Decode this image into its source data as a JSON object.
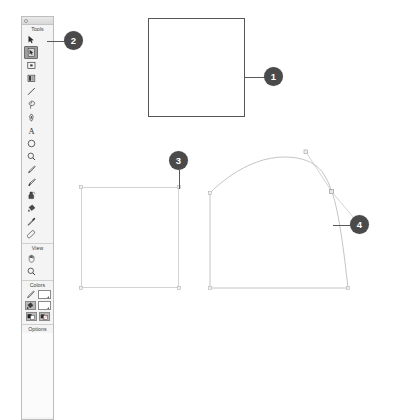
{
  "palette": {
    "title_icon": "window-dot",
    "sections": [
      {
        "id": "tools",
        "label": "Tools",
        "rows": [
          [
            {
              "name": "selection-arrow-tool",
              "icon": "arrow-pointer"
            },
            {
              "name": "subselection-tool",
              "icon": "hollow-arrow-page",
              "selected": true
            }
          ],
          [
            {
              "name": "free-transform-tool",
              "icon": "transform-box"
            },
            {
              "name": "gradient-transform-tool",
              "icon": "gradient-box"
            }
          ],
          [
            {
              "name": "line-tool",
              "icon": "diagonal-line"
            },
            {
              "name": "lasso-tool",
              "icon": "lasso"
            }
          ],
          [
            {
              "name": "pen-tool",
              "icon": "pen-nib"
            },
            {
              "name": "text-tool",
              "icon": "letter-a"
            }
          ],
          [
            {
              "name": "oval-tool",
              "icon": "circle-outline"
            },
            {
              "name": "magnifier-tool",
              "icon": "magnifier"
            }
          ],
          [
            {
              "name": "pencil-tool",
              "icon": "pencil"
            },
            {
              "name": "brush-tool",
              "icon": "paintbrush"
            }
          ],
          [
            {
              "name": "ink-bottle-tool",
              "icon": "ink-bottle"
            },
            {
              "name": "paint-bucket-tool",
              "icon": "paint-bucket"
            }
          ],
          [
            {
              "name": "eyedropper-tool",
              "icon": "eyedropper"
            },
            {
              "name": "eraser-tool",
              "icon": "eraser"
            }
          ]
        ]
      },
      {
        "id": "view",
        "label": "View",
        "rows": [
          [
            {
              "name": "hand-tool",
              "icon": "hand"
            },
            {
              "name": "zoom-tool",
              "icon": "magnifier"
            }
          ]
        ]
      },
      {
        "id": "colors",
        "label": "Colors",
        "rows": []
      },
      {
        "id": "options",
        "label": "Options",
        "rows": []
      }
    ],
    "colors": {
      "stroke_icon": "pencil-stroke-icon",
      "fill_icon": "paint-bucket-fill-icon",
      "stroke_swatch_color": "#b9b9b9",
      "fill_swatch_color": "#ffffff",
      "modifier_left_icon": "black-white-swatch-icon",
      "modifier_right_icon": "no-color-swatch-icon"
    }
  },
  "canvas": {
    "shapes": [
      {
        "name": "plain-square",
        "type": "rect",
        "stroke": "#55555a",
        "fill": "#ffffff"
      },
      {
        "name": "selected-square",
        "type": "rect",
        "stroke": "#d3d3d6",
        "fill": "#ffffff"
      },
      {
        "name": "bezier-deformed-square",
        "type": "path",
        "stroke": "#b9b9bd",
        "fill": "#ffffff"
      }
    ]
  },
  "callouts": [
    {
      "number": "1",
      "target": "plain-square"
    },
    {
      "number": "2",
      "target": "subselection-tool"
    },
    {
      "number": "3",
      "target": "square-corner-anchor"
    },
    {
      "number": "4",
      "target": "bezier-control-handle"
    }
  ]
}
